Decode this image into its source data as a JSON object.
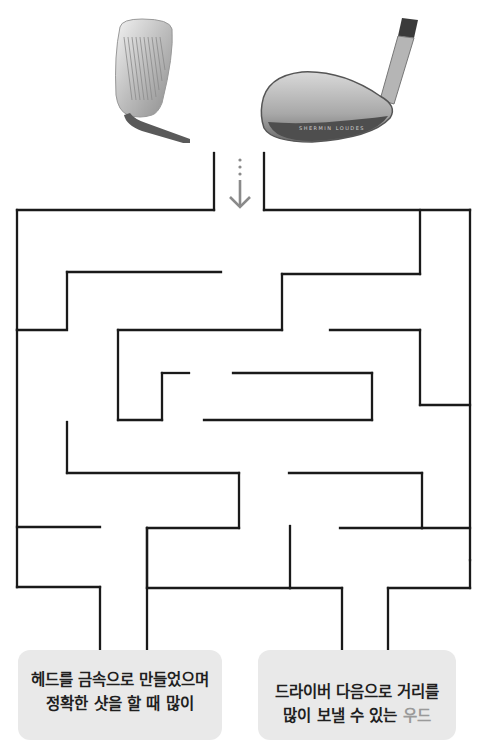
{
  "images": {
    "left_club": "iron-club-face",
    "right_club": "hybrid-iron-club-head",
    "right_club_engraving": "SHERMIN LOUDES"
  },
  "start_arrow": {
    "icon": "arrow-down-dotted-icon",
    "color": "#8a8a8a"
  },
  "maze": {
    "stroke_color": "#1a1a1a",
    "stroke_width": 2.3,
    "walls": [
      [
        214,
        153,
        214,
        210
      ],
      [
        214,
        210,
        17,
        210
      ],
      [
        17,
        210,
        17,
        330
      ],
      [
        264,
        153,
        264,
        210
      ],
      [
        264,
        210,
        470,
        210
      ],
      [
        470,
        210,
        470,
        560
      ],
      [
        420,
        210,
        420,
        274
      ],
      [
        420,
        274,
        282,
        274
      ],
      [
        282,
        274,
        282,
        330
      ],
      [
        282,
        330,
        118,
        330
      ],
      [
        67,
        328,
        67,
        272
      ],
      [
        67,
        272,
        221,
        272
      ],
      [
        17,
        330,
        67,
        330
      ],
      [
        118,
        330,
        118,
        420
      ],
      [
        118,
        420,
        162,
        420
      ],
      [
        162,
        420,
        162,
        373
      ],
      [
        162,
        373,
        189,
        373
      ],
      [
        233,
        373,
        372,
        373
      ],
      [
        372,
        373,
        372,
        420
      ],
      [
        372,
        420,
        204,
        420
      ],
      [
        330,
        330,
        420,
        330
      ],
      [
        420,
        330,
        420,
        405
      ],
      [
        420,
        405,
        470,
        405
      ],
      [
        67,
        422,
        67,
        473
      ],
      [
        67,
        473,
        239,
        473
      ],
      [
        239,
        473,
        239,
        528
      ],
      [
        239,
        528,
        147,
        528
      ],
      [
        147,
        528,
        147,
        660
      ],
      [
        17,
        330,
        17,
        587
      ],
      [
        17,
        527,
        100,
        527
      ],
      [
        17,
        587,
        100,
        587
      ],
      [
        100,
        587,
        100,
        660
      ],
      [
        289,
        473,
        422,
        473
      ],
      [
        422,
        473,
        422,
        528
      ],
      [
        422,
        528,
        470,
        528
      ],
      [
        340,
        528,
        422,
        528
      ],
      [
        290,
        526,
        290,
        588
      ],
      [
        147,
        588,
        290,
        588
      ],
      [
        290,
        588,
        342,
        588
      ],
      [
        342,
        588,
        342,
        660
      ],
      [
        470,
        560,
        470,
        588
      ],
      [
        470,
        588,
        388,
        588
      ],
      [
        388,
        588,
        388,
        660
      ],
      [
        147,
        528,
        147,
        588
      ]
    ]
  },
  "cards": [
    {
      "lines": [
        "헤드를 금속으로 만들었으며",
        "정확한 샷을 할 때 많이"
      ]
    },
    {
      "lines": [
        "드라이버 다음으로 거리를",
        "많이 보낼 수 있는"
      ],
      "highlight": "우드"
    }
  ]
}
